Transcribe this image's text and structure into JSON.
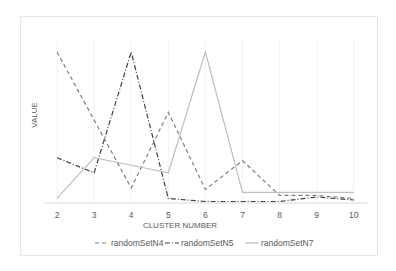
{
  "chart_data": {
    "type": "line",
    "title": "",
    "xlabel": "CLUSTER NUMBER",
    "ylabel": "VALUE",
    "x": [
      2,
      3,
      4,
      5,
      6,
      7,
      8,
      9,
      10
    ],
    "ylim": [
      0,
      100
    ],
    "y_ticks_visible": false,
    "grid": "vertical",
    "legend_position": "bottom",
    "series": [
      {
        "name": "randomSetN4",
        "style": "dashed",
        "color": "#7f7f7f",
        "values": [
          100,
          55,
          10,
          60,
          9,
          28,
          5,
          5,
          3
        ]
      },
      {
        "name": "randomSetN5",
        "style": "dash-dot",
        "color": "#404040",
        "values": [
          30,
          20,
          100,
          3,
          1,
          1,
          1,
          4,
          2
        ]
      },
      {
        "name": "randomSetN7",
        "style": "solid",
        "color": "#bfbfbf",
        "values": [
          3,
          30,
          25,
          20,
          100,
          7,
          7,
          7,
          7
        ]
      }
    ]
  }
}
